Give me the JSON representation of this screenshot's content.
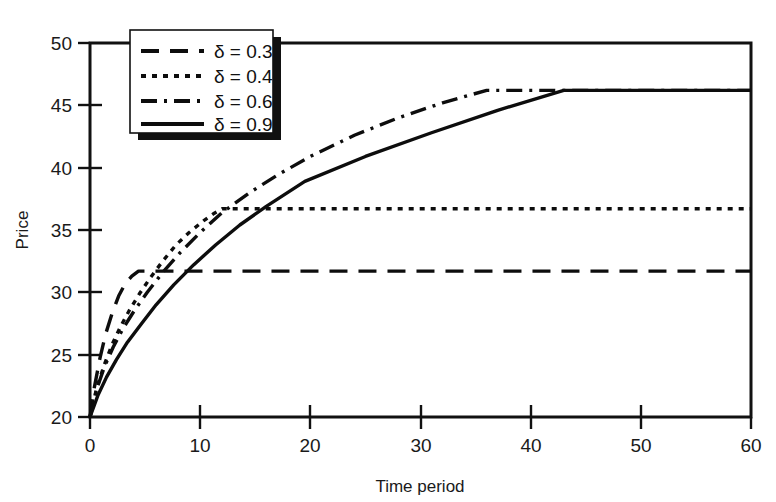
{
  "chart_data": {
    "type": "line",
    "title": "",
    "xlabel": "Time period",
    "ylabel": "Price",
    "xlim": [
      0,
      60
    ],
    "ylim": [
      20,
      50
    ],
    "xticks": [
      0,
      10,
      20,
      30,
      40,
      50,
      60
    ],
    "yticks": [
      20,
      25,
      30,
      35,
      40,
      45,
      50
    ],
    "xtick_labels": [
      "0",
      "10",
      "20",
      "30",
      "40",
      "50",
      "60"
    ],
    "ytick_labels": [
      "20",
      "25",
      "30",
      "35",
      "40",
      "45",
      "50"
    ],
    "grid": false,
    "legend_position": "upper-left-inside",
    "legend_entries": [
      "δ = 0.3",
      "δ = 0.4",
      "δ = 0.6",
      "δ = 0.9"
    ],
    "series": [
      {
        "name": "δ = 0.3",
        "label": "δ = 0.3",
        "dash": "dashed",
        "dasharray": "18 11",
        "plateau_value": 31.7,
        "plateau_start_x": 4.4,
        "x": [
          0,
          0.4,
          0.9,
          1.4,
          2.0,
          2.6,
          3.2,
          3.8,
          4.4,
          10,
          20,
          30,
          40,
          50,
          60
        ],
        "y": [
          20.0,
          22.4,
          24.7,
          26.6,
          28.3,
          29.7,
          30.7,
          31.3,
          31.7,
          31.7,
          31.7,
          31.7,
          31.7,
          31.7,
          31.7
        ]
      },
      {
        "name": "δ = 0.4",
        "label": "δ = 0.4",
        "dash": "dotted",
        "dasharray": "5 6",
        "plateau_value": 36.7,
        "plateau_start_x": 12.0,
        "x": [
          0,
          0.6,
          1.3,
          2.0,
          2.8,
          3.6,
          4.5,
          5.5,
          6.6,
          7.8,
          9.0,
          10.4,
          11.2,
          12.0,
          20,
          30,
          40,
          50,
          60
        ],
        "y": [
          20.0,
          22.3,
          24.2,
          25.8,
          27.3,
          28.6,
          29.9,
          31.2,
          32.5,
          33.8,
          34.8,
          35.8,
          36.3,
          36.7,
          36.7,
          36.7,
          36.7,
          36.7,
          36.7
        ]
      },
      {
        "name": "δ = 0.6",
        "label": "δ = 0.6",
        "dash": "dash-dot",
        "dasharray": "16 7 3 7",
        "plateau_value": 46.2,
        "plateau_start_x": 36.0,
        "x": [
          0,
          0.6,
          1.3,
          2.1,
          3.0,
          4.0,
          5.2,
          6.6,
          8.2,
          10.0,
          12.0,
          14.5,
          17.0,
          20.0,
          24.0,
          28.0,
          32.0,
          36.0,
          43.0,
          50,
          60
        ],
        "y": [
          20.0,
          22.2,
          24.0,
          25.6,
          27.1,
          28.5,
          30.0,
          31.6,
          33.2,
          34.8,
          36.4,
          38.0,
          39.4,
          40.9,
          42.6,
          44.0,
          45.2,
          46.2,
          46.2,
          46.2,
          46.2
        ]
      },
      {
        "name": "δ = 0.9",
        "label": "δ = 0.9",
        "dash": "solid",
        "dasharray": "",
        "plateau_value": 46.2,
        "plateau_start_x": 43.0,
        "kink_x": 19.5,
        "kink_y": 38.9,
        "x": [
          0,
          0.7,
          1.5,
          2.4,
          3.4,
          4.6,
          6.0,
          7.6,
          9.4,
          11.4,
          13.6,
          16.0,
          19.5,
          25.0,
          31.0,
          37.0,
          43.0,
          50,
          60
        ],
        "y": [
          20.0,
          21.7,
          23.2,
          24.6,
          26.0,
          27.4,
          29.0,
          30.6,
          32.2,
          33.8,
          35.4,
          36.9,
          38.9,
          40.9,
          42.8,
          44.6,
          46.2,
          46.2,
          46.2
        ]
      }
    ]
  },
  "figure": {
    "background_color": "#ffffff",
    "line_color": "#0d0d0d",
    "frame_color": "#111111"
  }
}
